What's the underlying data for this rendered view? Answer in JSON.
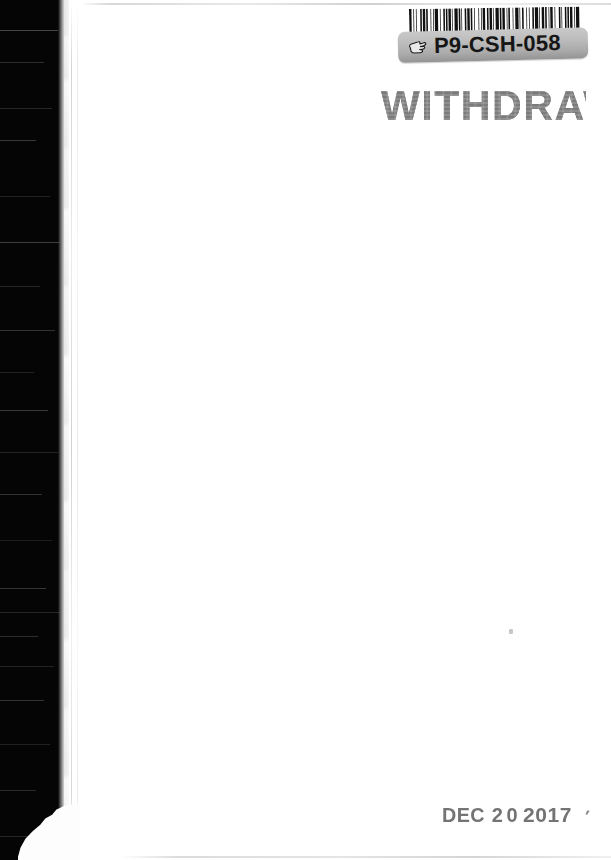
{
  "document": {
    "type": "scanned-book-endpaper",
    "width": 611,
    "height": 860,
    "paper_color": "#ffffff",
    "gutter_color": "#050505"
  },
  "barcode": {
    "name": "library-barcode",
    "symbology": "Code 39",
    "encoded_value": "P9-CSH-058",
    "bar_color": "#111111",
    "pattern": [
      3,
      2,
      1,
      2,
      1,
      4,
      2,
      1,
      3,
      1,
      2,
      3,
      1,
      2,
      1,
      1,
      4,
      2,
      1,
      3,
      2,
      1,
      2,
      1,
      3,
      1,
      1,
      2,
      4,
      1,
      2,
      1,
      1,
      3,
      2,
      1,
      3,
      1,
      2,
      2,
      1,
      4,
      1,
      2,
      1,
      1,
      3,
      2,
      2,
      1,
      3,
      1,
      1,
      2,
      4,
      1,
      2,
      1,
      3,
      2,
      1,
      1,
      2,
      3,
      1,
      2,
      4,
      1,
      1,
      2,
      2,
      3,
      1,
      2,
      1,
      3,
      2,
      1,
      4,
      1,
      1,
      2,
      3,
      1,
      2,
      2,
      1,
      1,
      3,
      2,
      1,
      4,
      2,
      1,
      1,
      3,
      2,
      1,
      2,
      1,
      3,
      2,
      1,
      1,
      4,
      2
    ]
  },
  "call_label": {
    "name": "call-number-label",
    "call_number": "P9-CSH-058",
    "icon": "pointing-hand-icon",
    "background_color": "#b8b8b8",
    "text_color": "#161616"
  },
  "stamps": {
    "withdrawn": {
      "name": "withdrawn-stamp",
      "text": "WITHDRAWN",
      "color": "#707070",
      "note": "right edge of final N is cropped by the page boundary"
    },
    "date": {
      "name": "date-stamp",
      "month": "DEC",
      "day_digit_1": "2",
      "day_digit_2": "0",
      "year": "2017",
      "full_text": "DEC 2 0 2017",
      "trailing_mark": "′",
      "color": "#6d6d6d"
    }
  },
  "artifacts": {
    "speck": "ink-speck",
    "torn_corner": "torn-page-corner",
    "crease": "spine-crease",
    "top_line": "scan-edge-line-top",
    "bottom_line": "scan-edge-line-bottom"
  }
}
